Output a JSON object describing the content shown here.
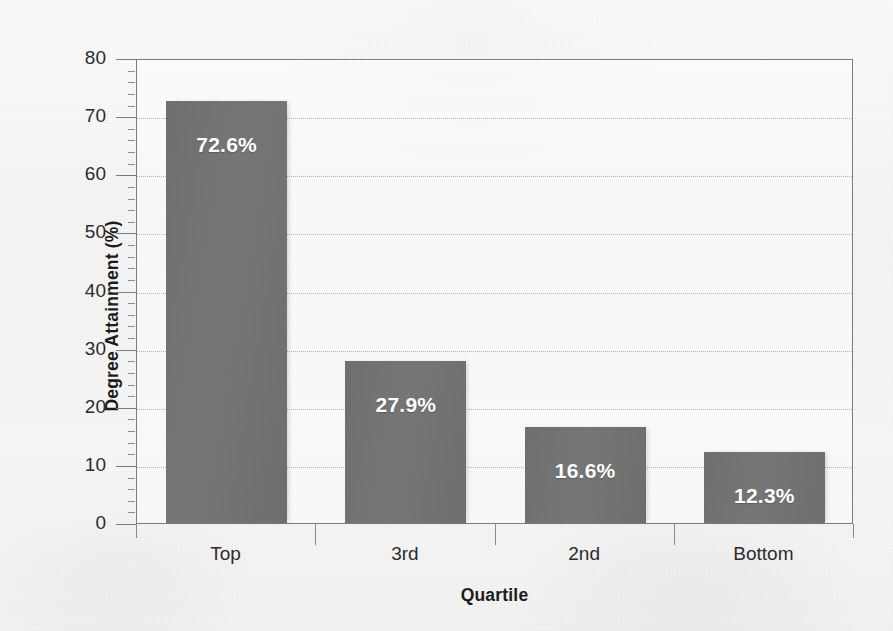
{
  "chart_data": {
    "type": "bar",
    "title": "",
    "subtitle": "",
    "xlabel": "Quartile",
    "ylabel": "Degree Attainment (%)",
    "categories": [
      "Top",
      "3rd",
      "2nd",
      "Bottom"
    ],
    "values": [
      72.6,
      27.9,
      16.6,
      12.3
    ],
    "data_labels": [
      "72.6%",
      "27.9%",
      "16.6%",
      "12.3%"
    ],
    "ylim": [
      0,
      80
    ],
    "y_major_ticks": [
      0,
      10,
      20,
      30,
      40,
      50,
      60,
      70,
      80
    ],
    "y_tick_labels": [
      "0",
      "10",
      "20",
      "30",
      "40",
      "50",
      "60",
      "70",
      "80"
    ],
    "y_minor_tick_interval": 2,
    "grid": "horizontal-dotted",
    "legend": "none",
    "series": [
      {
        "name": "Degree Attainment",
        "values": [
          72.6,
          27.9,
          16.6,
          12.3
        ]
      }
    ],
    "colors": {
      "bar_fill": "#737373",
      "bar_label_text": "#ffffff",
      "axis_line": "#7c7c7c",
      "gridline": "#b3b3b3",
      "tick_label_text": "#2c2c2c",
      "axis_title_text": "#1c1c1c",
      "background": "#f4f4f3"
    }
  }
}
